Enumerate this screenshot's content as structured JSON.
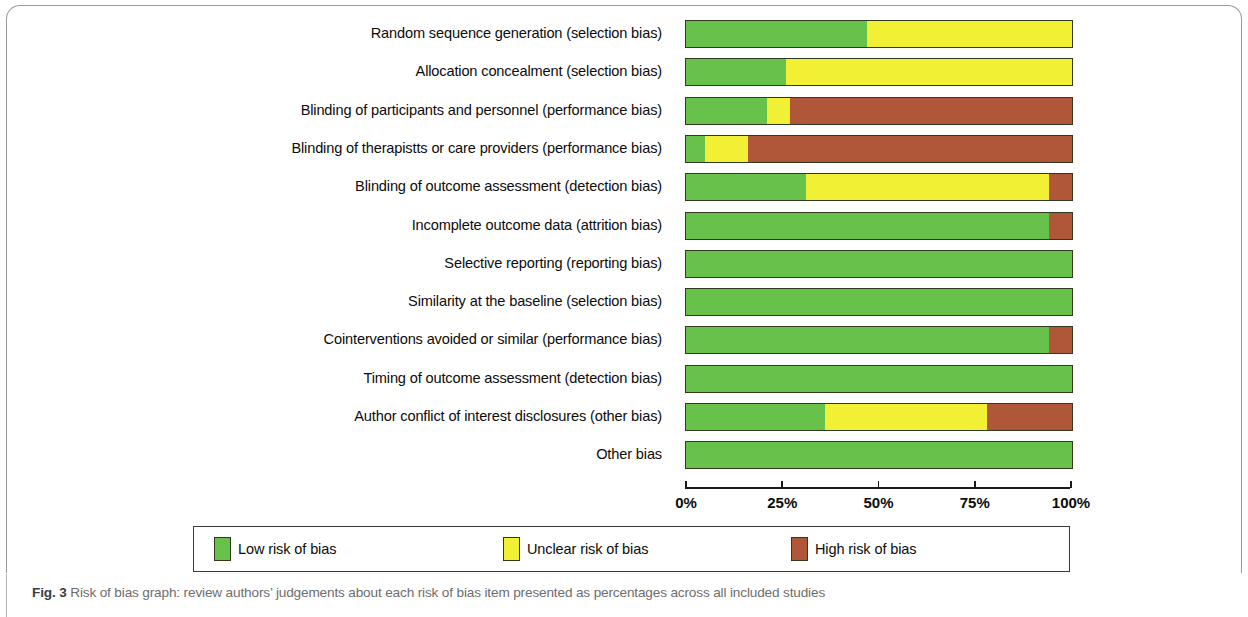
{
  "figure": {
    "number_label": "Fig. 3",
    "caption": "Risk of bias graph: review authors’ judgements about each risk of bias item presented as percentages across all included studies"
  },
  "legend": {
    "items": [
      {
        "label": "Low risk of bias",
        "color": "#67c14a",
        "key": "low"
      },
      {
        "label": "Unclear risk of bias",
        "color": "#f2f034",
        "key": "unclear"
      },
      {
        "label": "High risk of bias",
        "color": "#b0573a",
        "key": "high"
      }
    ]
  },
  "axis": {
    "ticks": [
      "0%",
      "25%",
      "50%",
      "75%",
      "100%"
    ],
    "tick_values": [
      0,
      25,
      50,
      75,
      100
    ]
  },
  "chart_data": {
    "type": "bar",
    "orientation": "horizontal",
    "stacked": true,
    "title": "Risk of bias graph",
    "xlabel": "",
    "ylabel": "",
    "xlim": [
      0,
      100
    ],
    "grid": false,
    "legend_position": "bottom",
    "categories": [
      "Random sequence generation (selection bias)",
      "Allocation concealment (selection bias)",
      "Blinding of participants and personnel (performance bias)",
      "Blinding of therapistts or care providers (performance bias)",
      "Blinding of outcome assessment (detection bias)",
      "Incomplete outcome data (attrition bias)",
      "Selective reporting (reporting bias)",
      "Similarity at the baseline (selection bias)",
      "Cointerventions avoided or similar (performance bias)",
      "Timing of outcome assessment (detection bias)",
      "Author conflict of interest disclosures (other bias)",
      "Other bias"
    ],
    "series": [
      {
        "name": "Low risk of bias",
        "color": "#67c14a",
        "values": [
          47,
          26,
          21,
          5,
          31,
          94,
          100,
          100,
          94,
          100,
          36,
          100
        ]
      },
      {
        "name": "Unclear risk of bias",
        "color": "#f2f034",
        "values": [
          53,
          74,
          6,
          11,
          63,
          0,
          0,
          0,
          0,
          0,
          42,
          0
        ]
      },
      {
        "name": "High risk of bias",
        "color": "#b0573a",
        "values": [
          0,
          0,
          73,
          84,
          6,
          6,
          0,
          0,
          6,
          0,
          22,
          0
        ]
      }
    ]
  }
}
